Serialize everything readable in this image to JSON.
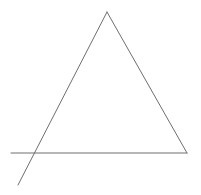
{
  "diagram": {
    "type": "line-drawing",
    "shape": "triangle",
    "canvas": {
      "width": 201,
      "height": 195,
      "background": "#ffffff"
    },
    "stroke": {
      "color": "#6e6e6e",
      "width": 1
    },
    "lines": [
      {
        "name": "base-line",
        "x1": 11,
        "y1": 153,
        "x2": 187,
        "y2": 153
      },
      {
        "name": "right-side",
        "x1": 107,
        "y1": 12,
        "x2": 187,
        "y2": 153
      },
      {
        "name": "left-side-extended",
        "x1": 107,
        "y1": 12,
        "x2": 18,
        "y2": 185
      }
    ],
    "vertices": {
      "apex": {
        "x": 107,
        "y": 12
      },
      "bottom-right": {
        "x": 187,
        "y": 153
      },
      "bottom-left-intersection": {
        "x": 35,
        "y": 153
      }
    }
  }
}
